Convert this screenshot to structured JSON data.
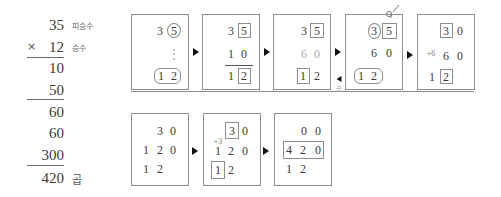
{
  "column_multiplication": {
    "multiplicand": "35",
    "multiplicand_label": "피승수",
    "operator": "×",
    "multiplier": "12",
    "multiplier_label": "승수",
    "partial_rows": [
      "10",
      "50",
      "60",
      "60",
      "300"
    ],
    "product": "420",
    "product_label": "곱"
  },
  "steps": [
    {
      "row1": [
        "3",
        "5"
      ],
      "row2": [
        "⋮"
      ],
      "row3": [
        "1",
        "2"
      ]
    },
    {
      "row1": [
        "3",
        "5"
      ],
      "row2": [
        "1",
        "0"
      ],
      "row3": [
        "1",
        "2"
      ]
    },
    {
      "row1": [
        "3",
        "5"
      ],
      "row2": [
        "6",
        "0"
      ],
      "row3": [
        "1",
        "2"
      ]
    },
    {
      "row1": [
        "3",
        "5"
      ],
      "row2": [
        "6",
        "0"
      ],
      "row3": [
        "1",
        "2"
      ]
    },
    {
      "row1": [
        "3",
        "0"
      ],
      "carry": "+6",
      "row2": [
        "6",
        "0"
      ],
      "row3": [
        "1",
        "2"
      ]
    },
    {
      "row1": [
        "3",
        "0"
      ],
      "row2": [
        "1",
        "2",
        "0"
      ],
      "row3": [
        "1",
        "2"
      ]
    },
    {
      "row1": [
        "3",
        "0"
      ],
      "carry": "+3",
      "row2": [
        "1",
        "2",
        "0"
      ],
      "row3": [
        "1",
        "2"
      ]
    },
    {
      "row1": [
        "0",
        "0"
      ],
      "row2": [
        "4",
        "2",
        "0"
      ],
      "row3": [
        "1",
        "2"
      ]
    }
  ],
  "back_arrow_label": "곱",
  "icons": {
    "next_arrow": "arrow-right-triangle",
    "back_arrow": "arrow-left-triangle",
    "carry_mark": "carry-mark"
  },
  "colors": {
    "text": "#3a3a3a",
    "border": "#8c8c8c",
    "faded_digit": "#a8a8a8",
    "arrow": "#111111"
  }
}
